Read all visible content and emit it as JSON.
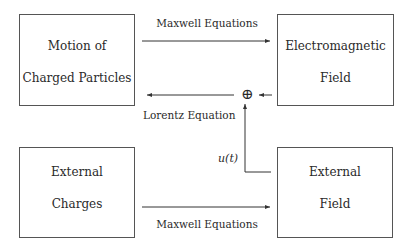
{
  "diagram": {
    "boxes": {
      "motion": {
        "lines": [
          "Motion of",
          "Charged Particles"
        ]
      },
      "em_field": {
        "lines": [
          "Electromagnetic",
          "Field"
        ]
      },
      "ext_charges": {
        "lines": [
          "External",
          "Charges"
        ]
      },
      "ext_field": {
        "lines": [
          "External",
          "Field"
        ]
      }
    },
    "edges": {
      "top_maxwell": {
        "label": "Maxwell Equations",
        "from": "Motion of Charged Particles",
        "to": "Electromagnetic Field"
      },
      "lorentz": {
        "label": "Lorentz Equation",
        "from": "Electromagnetic Field",
        "to": "Motion of Charged Particles",
        "via": "sum junction"
      },
      "bottom_maxwell": {
        "label": "Maxwell Equations",
        "from": "External Charges",
        "to": "External Field"
      },
      "control": {
        "label": "u(t)",
        "from": "External Field",
        "to": "sum junction"
      }
    },
    "junction": {
      "symbol": "⊕"
    },
    "colors": {
      "line": "#333333",
      "box_border": "#555555",
      "text": "#2a2a2a"
    }
  }
}
